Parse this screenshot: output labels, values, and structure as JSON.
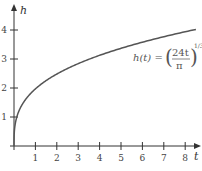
{
  "chart_data": {
    "type": "line",
    "title": "",
    "xlabel": "t",
    "ylabel": "h",
    "xlim": [
      0,
      8.6
    ],
    "ylim": [
      0,
      4.5
    ],
    "x_ticks": [
      "1",
      "2",
      "3",
      "4",
      "5",
      "6",
      "7",
      "8"
    ],
    "y_ticks": [
      "1",
      "2",
      "3",
      "4"
    ],
    "grid": false,
    "legend": "none",
    "annotation": {
      "lhs": "h(t) =",
      "numerator": "24t",
      "denominator": "π",
      "exponent": "1/3"
    },
    "series": [
      {
        "name": "h(t) = (24t/π)^(1/3)",
        "x": [
          0,
          0.05,
          0.1,
          0.25,
          0.5,
          1,
          1.5,
          2,
          3,
          4,
          5,
          6,
          7,
          8,
          8.5
        ],
        "y": [
          0,
          0.73,
          0.91,
          1.24,
          1.56,
          1.97,
          2.25,
          2.48,
          2.84,
          3.13,
          3.37,
          3.58,
          3.77,
          3.94,
          4.02
        ]
      }
    ],
    "colors": {
      "curve": "#555555",
      "axes": "#333333"
    }
  }
}
